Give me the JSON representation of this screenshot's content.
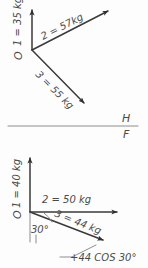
{
  "figure": {
    "title_visible": false,
    "background_color": "#fdfdfd",
    "ink_color": "#3a3a3a"
  },
  "divider": {
    "name": "horizontal-rule",
    "label_above": "H",
    "label_below": "F"
  },
  "upper_diagram": {
    "name": "upper-force-diagram",
    "origin_label": "O",
    "vectors": [
      {
        "id": "1",
        "label": "1 = 35 kg",
        "magnitude": 35,
        "unit": "kg",
        "direction": "up",
        "angle_deg": 90
      },
      {
        "id": "2",
        "label": "2 = 57kg",
        "magnitude": 57,
        "unit": "kg",
        "direction": "up-right",
        "angle_deg": 30
      },
      {
        "id": "3",
        "label": "3 = 55 kg",
        "magnitude": 55,
        "unit": "kg",
        "direction": "down-right",
        "angle_deg": -45
      }
    ]
  },
  "lower_diagram": {
    "name": "lower-force-diagram",
    "origin_label": "O",
    "angle_label": "30°",
    "annotation": "+44 COS 30°",
    "vectors": [
      {
        "id": "1",
        "label": "1 = 40 kg",
        "magnitude": 40,
        "unit": "kg",
        "direction": "up",
        "angle_deg": 90
      },
      {
        "id": "2",
        "label": "2 = 50 kg",
        "magnitude": 50,
        "unit": "kg",
        "direction": "right",
        "angle_deg": 0
      },
      {
        "id": "3",
        "label": "3 = 44 kg",
        "magnitude": 44,
        "unit": "kg",
        "direction": "down-right",
        "angle_deg": -30
      }
    ]
  }
}
